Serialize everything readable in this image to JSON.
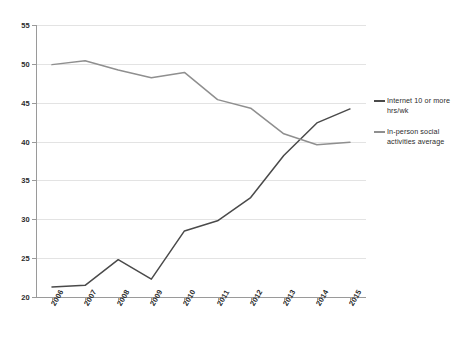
{
  "chart_data": {
    "type": "line",
    "title": "",
    "subtitle": "",
    "xlabel": "",
    "ylabel": "",
    "x": [
      "2006",
      "2007",
      "2008",
      "2009",
      "2010",
      "2011",
      "2012",
      "2013",
      "2014",
      "2015"
    ],
    "categories": [
      "2006",
      "2007",
      "2008",
      "2009",
      "2010",
      "2011",
      "2012",
      "2013",
      "2014",
      "2015"
    ],
    "ylim": [
      20,
      55
    ],
    "yticks": [
      "20",
      "25",
      "30",
      "35",
      "40",
      "45",
      "50",
      "55"
    ],
    "grid": "horizontal",
    "legend_position": "right",
    "series": [
      {
        "name": "Internet 10 or more hrs/wk",
        "color": "#4a4a4a",
        "values": [
          21.3,
          21.5,
          24.8,
          22.3,
          28.5,
          29.8,
          32.8,
          38.2,
          42.4,
          44.2
        ]
      },
      {
        "name": "In-person social activities average",
        "color": "#8f8f8f",
        "values": [
          49.9,
          50.4,
          49.2,
          48.2,
          48.9,
          45.4,
          44.3,
          41.0,
          39.6,
          39.9
        ]
      }
    ]
  },
  "legend": {
    "entries": [
      {
        "label": "Internet 10 or more hrs/wk",
        "color": "#4a4a4a"
      },
      {
        "label": "In-person social activities average",
        "color": "#8f8f8f"
      }
    ]
  },
  "colors": {
    "background": "#ffffff",
    "grid": "#e3e3e3",
    "axis": "#9a9a9a",
    "text": "#2b2b2b",
    "series_internet": "#4a4a4a",
    "series_inperson": "#8f8f8f"
  }
}
